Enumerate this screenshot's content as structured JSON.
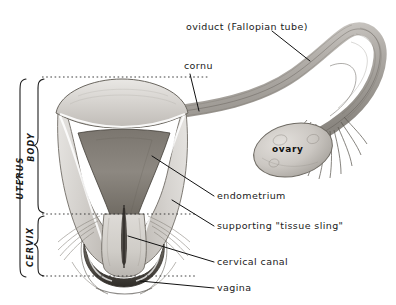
{
  "figure": {
    "background_color": "#ffffff",
    "ink_color": "#1a1a1a",
    "width": 396,
    "height": 305
  },
  "labels": {
    "oviduct": "oviduct  (Fallopian tube)",
    "cornu": "cornu",
    "ovary": "ovary",
    "endometrium": "endometrium",
    "tissue_sling": "supporting \"tissue sling\"",
    "cervical_canal": "cervical canal",
    "vagina": "vagina"
  },
  "brackets": {
    "uterus": "UTERUS",
    "body": "BODY",
    "cervix": "CERVIX"
  },
  "structures": {
    "fundus": "uterine-fundus",
    "broad_ligament_left": "broad-ligament-left",
    "broad_ligament_right": "broad-ligament-right",
    "endometrial_cavity": "endometrial-cavity",
    "cervix_body": "cervix-body",
    "cervical_canal": "cervical-canal-channel",
    "vaginal_fornix": "vaginal-fornix",
    "oviduct_tube": "oviduct-tube",
    "fimbriae": "fimbriae",
    "ovary_body": "ovary-oval"
  },
  "guides": {
    "top_dotted": "fundus-level-guide",
    "mid_dotted": "body-cervix-boundary-guide",
    "bottom_dotted": "cervix-base-guide"
  }
}
